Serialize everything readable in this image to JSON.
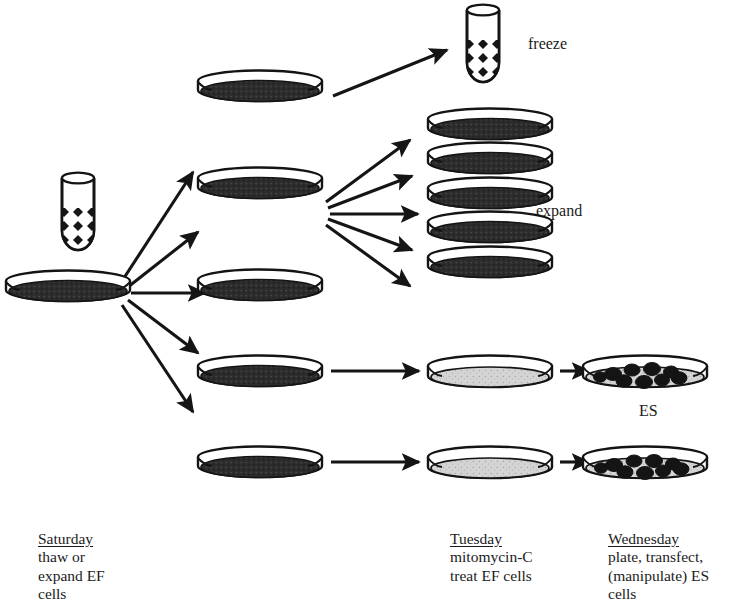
{
  "diagram": {
    "background_color": "#ffffff",
    "ink_color": "#1a1a1a",
    "confluent_fill": "#2b2b2b",
    "treated_fill": "#d2d2d2",
    "colony_fill": "#1a1a1a"
  },
  "side_labels": {
    "freeze": "freeze",
    "expand": "expand",
    "es": "ES"
  },
  "captions": {
    "saturday": {
      "day": "Saturday",
      "body": "thaw or\nexpand EF\ncells"
    },
    "tuesday": {
      "day": "Tuesday",
      "body": "mitomycin-C\ntreat EF cells"
    },
    "wednesday": {
      "day": "Wednesday",
      "body": "plate, transfect,\n(manipulate) ES\ncells"
    }
  },
  "objects": {
    "vials": [
      {
        "name": "source-vial",
        "x": 78,
        "y": 212,
        "note": "frozen EF cell vial, hatched contents"
      },
      {
        "name": "freeze-vial",
        "x": 483,
        "y": 40,
        "note": "EF cells frozen back down"
      }
    ],
    "source_dish": {
      "name": "saturday-dish",
      "x": 68,
      "y": 290,
      "fill": "confluent"
    },
    "saturday_split_dishes": [
      {
        "x": 260,
        "y": 90,
        "fill": "confluent"
      },
      {
        "x": 260,
        "y": 186,
        "fill": "confluent"
      },
      {
        "x": 260,
        "y": 288,
        "fill": "confluent"
      },
      {
        "x": 260,
        "y": 374,
        "fill": "confluent"
      },
      {
        "x": 260,
        "y": 465,
        "fill": "confluent"
      }
    ],
    "expand_stack": [
      {
        "x": 490,
        "y": 124,
        "fill": "confluent"
      },
      {
        "x": 490,
        "y": 158,
        "fill": "confluent"
      },
      {
        "x": 490,
        "y": 193,
        "fill": "confluent"
      },
      {
        "x": 490,
        "y": 228,
        "fill": "confluent"
      },
      {
        "x": 490,
        "y": 262,
        "fill": "confluent"
      }
    ],
    "tuesday_dishes": [
      {
        "x": 490,
        "y": 374,
        "fill": "treated"
      },
      {
        "x": 490,
        "y": 465,
        "fill": "treated"
      }
    ],
    "wednesday_dishes": [
      {
        "x": 645,
        "y": 374,
        "fill": "treated",
        "colonies": 9
      },
      {
        "x": 645,
        "y": 465,
        "fill": "treated",
        "colonies": 9
      }
    ]
  },
  "arrows": {
    "saturday_fan": [
      {
        "x1": 120,
        "y1": 283,
        "x2": 196,
        "y2": 176,
        "to": "dish-1"
      },
      {
        "x1": 126,
        "y1": 288,
        "x2": 200,
        "y2": 234,
        "to": "dish-2"
      },
      {
        "x1": 130,
        "y1": 293,
        "x2": 206,
        "y2": 293,
        "to": "dish-3"
      },
      {
        "x1": 126,
        "y1": 300,
        "x2": 200,
        "y2": 355,
        "to": "dish-4"
      },
      {
        "x1": 120,
        "y1": 305,
        "x2": 196,
        "y2": 410,
        "to": "dish-5"
      }
    ],
    "freeze_arrow": {
      "x1": 333,
      "y1": 95,
      "x2": 446,
      "y2": 48
    },
    "expand_fan": [
      {
        "x1": 325,
        "y1": 205,
        "x2": 412,
        "y2": 143
      },
      {
        "x1": 327,
        "y1": 210,
        "x2": 414,
        "y2": 178
      },
      {
        "x1": 329,
        "y1": 214,
        "x2": 418,
        "y2": 214
      },
      {
        "x1": 327,
        "y1": 218,
        "x2": 414,
        "y2": 249
      },
      {
        "x1": 325,
        "y1": 223,
        "x2": 412,
        "y2": 284
      }
    ],
    "tuesday_arrows": [
      {
        "x1": 330,
        "y1": 374,
        "x2": 420,
        "y2": 374
      },
      {
        "x1": 330,
        "y1": 465,
        "x2": 420,
        "y2": 465
      }
    ],
    "wednesday_arrows": [
      {
        "x1": 558,
        "y1": 374,
        "x2": 588,
        "y2": 374
      },
      {
        "x1": 558,
        "y1": 465,
        "x2": 588,
        "y2": 465
      }
    ]
  }
}
